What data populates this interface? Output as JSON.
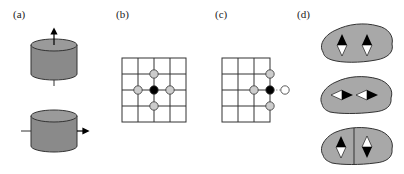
{
  "panels": [
    {
      "id": "a",
      "label": "(a)",
      "description": "Two cylinders with magnetization arrows: vertical (top) and horizontal (bottom)"
    },
    {
      "id": "b",
      "label": "(b)",
      "description": "4x4 lattice with central black site and four grey nearest neighbours"
    },
    {
      "id": "c",
      "label": "(c)",
      "description": "Lattice edge with black site on boundary, three grey neighbours and one missing (white) neighbour"
    },
    {
      "id": "d",
      "label": "(d)",
      "description": "Three grains with two magnetic moments: parallel vertical, head-to-tail horizontal, and antiparallel separated by a boundary"
    }
  ],
  "colors": {
    "cylinder_fill": "#8a8a8a",
    "cylinder_top": "#9a9a9a",
    "grain_fill": "#a8a8a8",
    "neighbor_fill": "#cccccc",
    "center_fill": "#000000",
    "missing_fill": "#ffffff",
    "grid_line": "#333333"
  }
}
